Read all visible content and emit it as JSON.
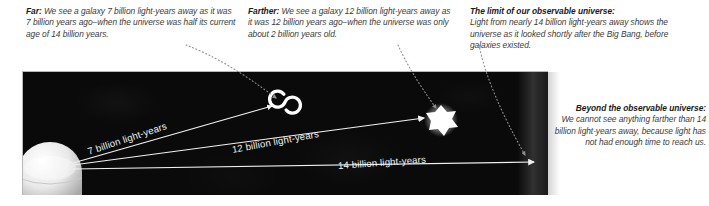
{
  "figure": {
    "panel_background": "#0a0a0a",
    "ray_color": "#f0f0f0",
    "leader_color": "#9a9a9a"
  },
  "callouts": [
    {
      "id": "far",
      "heading": "Far:",
      "body": "We see a galaxy 7 billion light-years away as it was 7 billion years ago–when the universe was half its current age of 14 billion years."
    },
    {
      "id": "farther",
      "heading": "Farther:",
      "body": "We see a galaxy 12 billion light-years away as it was 12 billion years ago–when the universe was only about 2 billion years old."
    },
    {
      "id": "limit",
      "heading": "The limit of our observable universe:",
      "body": "Light from nearly 14 billion light-years away shows the universe as it looked shortly after the Big Bang, before galaxies existed."
    },
    {
      "id": "beyond",
      "heading": "Beyond the observable universe:",
      "body": "We cannot see anything farther than 14 billion light-years away, because light has not had enough time to reach us."
    }
  ],
  "rays": [
    {
      "id": "ray-7",
      "label": "7 billion light-years",
      "distance_billion_ly": 7,
      "target": "spiral-galaxy"
    },
    {
      "id": "ray-12",
      "label": "12 billion light-years",
      "distance_billion_ly": 12,
      "target": "young-galaxy"
    },
    {
      "id": "ray-14",
      "label": "14 billion light-years",
      "distance_billion_ly": 14,
      "target": "observable-limit"
    }
  ],
  "objects": [
    {
      "id": "observer",
      "name": "earth-observer-dome"
    },
    {
      "id": "spiral-galaxy",
      "name": "spiral-galaxy"
    },
    {
      "id": "young-galaxy",
      "name": "young-galaxy-blob"
    }
  ]
}
